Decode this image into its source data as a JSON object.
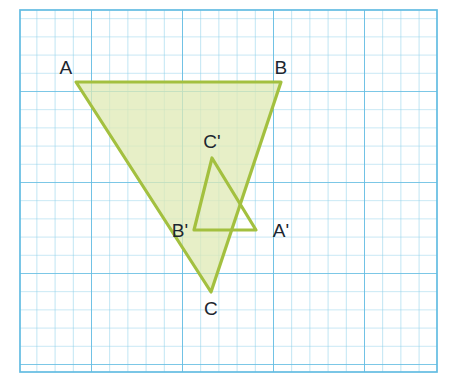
{
  "figure": {
    "background_color": "#ffffff",
    "grid": {
      "line_color": "#7ec8e8",
      "major_line_color": "#5fb8e0",
      "cell_size_px": 18.2,
      "x_start": 20,
      "y_start": 10,
      "x_end": 437,
      "y_end": 372,
      "columns": 23,
      "rows": 20,
      "major_every": 5,
      "grid_on": true
    },
    "shapes": [
      {
        "name": "triangle-abc",
        "label": "ABC",
        "stroke_color": "#a3c03f",
        "fill_color": "#dfeab4",
        "fill_opacity": 0.75,
        "stroke_width": 3.2,
        "points": "76,82 281,82 211,292",
        "vertices": [
          {
            "name": "A",
            "x": 76,
            "y": 82
          },
          {
            "name": "B",
            "x": 281,
            "y": 82
          },
          {
            "name": "C",
            "x": 211,
            "y": 292
          }
        ]
      },
      {
        "name": "triangle-a-prime-b-prime-c-prime",
        "label": "A'B'C'",
        "stroke_color": "#a3c03f",
        "fill_color": "#dfeab4",
        "fill_opacity": 0.0,
        "stroke_width": 3.2,
        "points": "256,230 194,230 212,158",
        "vertices": [
          {
            "name": "A'",
            "x": 256,
            "y": 230
          },
          {
            "name": "B'",
            "x": 194,
            "y": 230
          },
          {
            "name": "C'",
            "x": 212,
            "y": 158
          }
        ]
      }
    ],
    "labels": [
      {
        "name": "label-A",
        "text": "A",
        "x": 66,
        "y": 74,
        "anchor": "middle"
      },
      {
        "name": "label-B",
        "text": "B",
        "x": 281,
        "y": 74,
        "anchor": "middle"
      },
      {
        "name": "label-C",
        "text": "C",
        "x": 211,
        "y": 315,
        "anchor": "middle"
      },
      {
        "name": "label-Aprime",
        "text": "A'",
        "x": 281,
        "y": 237,
        "anchor": "middle"
      },
      {
        "name": "label-Bprime",
        "text": "B'",
        "x": 180,
        "y": 237,
        "anchor": "middle"
      },
      {
        "name": "label-Cprime",
        "text": "C'",
        "x": 212,
        "y": 148,
        "anchor": "middle"
      }
    ]
  }
}
